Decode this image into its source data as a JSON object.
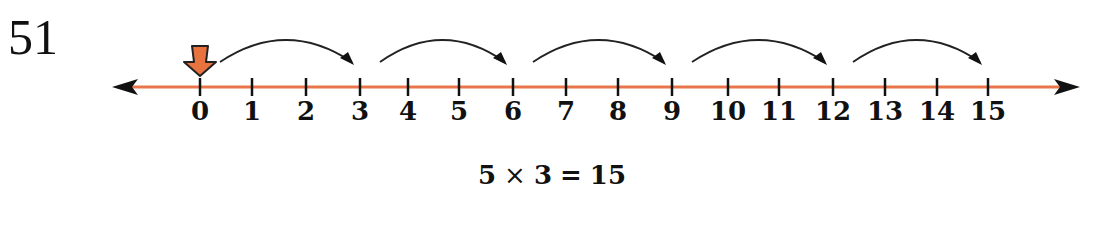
{
  "problem": {
    "number": "51"
  },
  "number_line": {
    "line_color": "#e8764a",
    "arrow_color": "#111111",
    "start_marker_color": "#e8733e",
    "start_marker_icon": "down-arrow-icon",
    "ticks": [
      {
        "label": "0",
        "x": 200
      },
      {
        "label": "1",
        "x": 252
      },
      {
        "label": "2",
        "x": 306
      },
      {
        "label": "3",
        "x": 360
      },
      {
        "label": "4",
        "x": 408
      },
      {
        "label": "5",
        "x": 459
      },
      {
        "label": "6",
        "x": 513
      },
      {
        "label": "7",
        "x": 566
      },
      {
        "label": "8",
        "x": 618
      },
      {
        "label": "9",
        "x": 672
      },
      {
        "label": "10",
        "x": 728
      },
      {
        "label": "11",
        "x": 779
      },
      {
        "label": "12",
        "x": 833
      },
      {
        "label": "13",
        "x": 885
      },
      {
        "label": "14",
        "x": 937
      },
      {
        "label": "15",
        "x": 988
      }
    ],
    "jumps": [
      {
        "from": "0",
        "to": "3"
      },
      {
        "from": "3",
        "to": "6"
      },
      {
        "from": "6",
        "to": "9"
      },
      {
        "from": "9",
        "to": "12"
      },
      {
        "from": "12",
        "to": "15"
      }
    ],
    "jump_size": 3,
    "jump_count": 5
  },
  "equation": {
    "left": "5",
    "operator": "×",
    "right": "3",
    "equals": "=",
    "result": "15"
  }
}
